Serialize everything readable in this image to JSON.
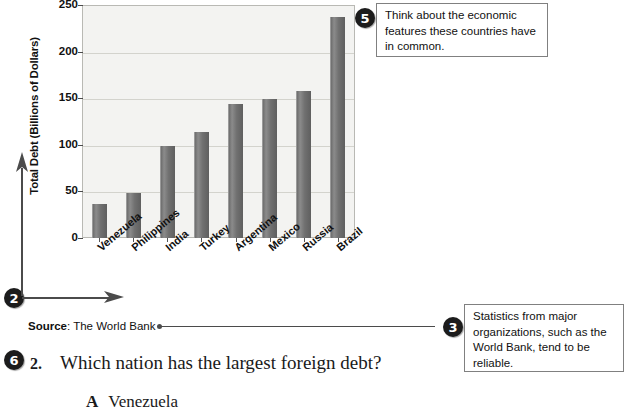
{
  "chart_data": {
    "type": "bar",
    "title": "",
    "xlabel": "",
    "ylabel": "Total Debt (Billions of Dollars)",
    "categories": [
      "Venezuela",
      "Philippines",
      "India",
      "Turkey",
      "Argentina",
      "Mexico",
      "Russia",
      "Brazil"
    ],
    "values": [
      37,
      48,
      99,
      114,
      144,
      149,
      158,
      237
    ],
    "yticks": [
      0,
      50,
      100,
      150,
      200,
      250
    ],
    "ylim": [
      0,
      250
    ],
    "grid": true,
    "legend": "none",
    "bar_color": "#6f6f6f",
    "plot_background": "#f3f3f1"
  },
  "source": {
    "label": "Source",
    "separator": ":",
    "value": "The World Bank"
  },
  "callouts": [
    {
      "number": "5",
      "text": "Think about the economic features these countries have in common."
    },
    {
      "number": "3",
      "text": "Statistics from major organizations, such as the World Bank, tend to be reliable."
    }
  ],
  "markers": {
    "axes_marker": "2",
    "question_marker": "6"
  },
  "question": {
    "number": "2.",
    "text": "Which nation has the largest foreign debt?",
    "answers": [
      {
        "letter": "A",
        "text": "Venezuela"
      }
    ]
  }
}
